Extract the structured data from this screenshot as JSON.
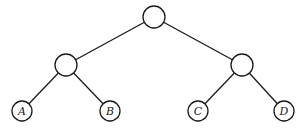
{
  "diagram": {
    "type": "binary-tree",
    "colors": {
      "stroke": "#1a1a1a",
      "fill": "#ffffff",
      "label": "#222222"
    },
    "nodes": [
      {
        "id": "root",
        "label": "",
        "x": 154,
        "y": 17,
        "r": 11
      },
      {
        "id": "left",
        "label": "",
        "x": 66,
        "y": 65,
        "r": 11
      },
      {
        "id": "right",
        "label": "",
        "x": 242,
        "y": 65,
        "r": 11
      },
      {
        "id": "A",
        "label": "A",
        "x": 22,
        "y": 111,
        "r": 10
      },
      {
        "id": "B",
        "label": "B",
        "x": 110,
        "y": 111,
        "r": 10
      },
      {
        "id": "C",
        "label": "C",
        "x": 198,
        "y": 111,
        "r": 10
      },
      {
        "id": "D",
        "label": "D",
        "x": 284,
        "y": 111,
        "r": 10
      }
    ],
    "edges": [
      {
        "from": "root",
        "to": "left"
      },
      {
        "from": "root",
        "to": "right"
      },
      {
        "from": "left",
        "to": "A"
      },
      {
        "from": "left",
        "to": "B"
      },
      {
        "from": "right",
        "to": "C"
      },
      {
        "from": "right",
        "to": "D"
      }
    ]
  }
}
